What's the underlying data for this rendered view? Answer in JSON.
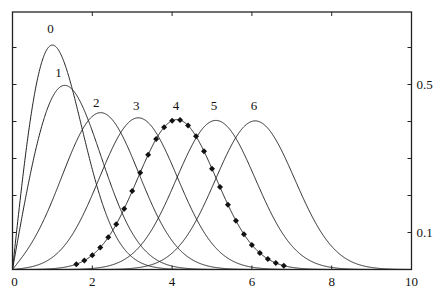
{
  "chart_data": {
    "type": "line",
    "title": "",
    "xlabel": "",
    "ylabel": "",
    "xlim": [
      0,
      10
    ],
    "ylim": [
      0,
      0.65
    ],
    "grid": false,
    "legend": "none (curves labelled 0-6 above their peaks)",
    "x_ticks": [
      0,
      2,
      4,
      6,
      8,
      10
    ],
    "x_tick_labels": [
      "0",
      "2",
      "4",
      "6",
      "8",
      "10"
    ],
    "y_ticks": [
      0.1,
      0.2,
      0.3,
      0.4,
      0.5,
      0.6
    ],
    "y_tick_labels_right": [
      {
        "value": 0.1,
        "label": "0.1"
      },
      {
        "value": 0.5,
        "label": "0.5"
      }
    ],
    "series": [
      {
        "name": "0",
        "nu": 0,
        "peak": [
          1.0,
          0.61
        ],
        "label_pos": [
          0.95,
          0.64
        ],
        "x": [
          0,
          0.5,
          1,
          1.5,
          2,
          2.5,
          3,
          3.5,
          4,
          4.5,
          5
        ],
        "values": [
          0,
          0.441,
          0.607,
          0.487,
          0.271,
          0.11,
          0.033,
          0.008,
          0.001,
          0,
          0
        ]
      },
      {
        "name": "1",
        "nu": 1,
        "peak": [
          1.35,
          0.49
        ],
        "label_pos": [
          1.15,
          0.52
        ],
        "x": [
          0,
          0.5,
          1,
          1.5,
          2,
          2.5,
          3,
          3.5,
          4,
          4.5,
          5
        ],
        "values": [
          0,
          0.285,
          0.466,
          0.487,
          0.374,
          0.219,
          0.099,
          0.034,
          0.009,
          0.002,
          0
        ]
      },
      {
        "name": "2",
        "nu": 2,
        "peak": [
          2.24,
          0.42
        ],
        "label_pos": [
          2.1,
          0.44
        ]
      },
      {
        "name": "3",
        "nu": 3,
        "peak": [
          3.14,
          0.405
        ],
        "label_pos": [
          3.1,
          0.43
        ]
      },
      {
        "name": "4",
        "nu": 4,
        "peak": [
          4.12,
          0.4
        ],
        "label_pos": [
          4.1,
          0.43
        ]
      },
      {
        "name": "5",
        "nu": 5,
        "peak": [
          5.05,
          0.4
        ],
        "label_pos": [
          5.05,
          0.43
        ]
      },
      {
        "name": "6",
        "nu": 6,
        "peak": [
          6.03,
          0.4
        ],
        "label_pos": [
          6.05,
          0.43
        ]
      }
    ],
    "markers": {
      "series": "4",
      "style": "filled diamonds",
      "x_start": 1.6,
      "x_end": 6.8,
      "x_step": 0.2
    }
  },
  "axes": {
    "x_labels": [
      "0",
      "2",
      "4",
      "6",
      "8",
      "10"
    ],
    "right_labels": [
      "0.5",
      "0.1"
    ]
  }
}
